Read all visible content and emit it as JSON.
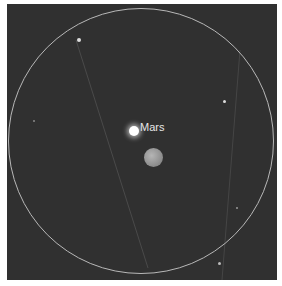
{
  "sky_view": {
    "planet_label": "Mars",
    "colors": {
      "sky": "#303030",
      "ring": "#b8b8b8",
      "label": "#e6e6e6",
      "moon": "#9a9a9a"
    }
  }
}
